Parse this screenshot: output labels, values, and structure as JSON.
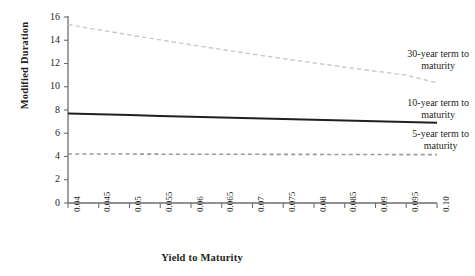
{
  "chart_data": {
    "type": "line",
    "title": "",
    "xlabel": "Yield to Maturity",
    "ylabel": "Modified Duration",
    "xlim": [
      0.04,
      0.1
    ],
    "ylim": [
      0,
      16
    ],
    "grid": false,
    "legend_position": "inline-right-annotations",
    "xticks": [
      "0.04",
      "0.045",
      "0.05",
      "0.055",
      "0.06",
      "0.065",
      "0.07",
      "0.075",
      "0.08",
      "0.085",
      "0.09",
      "0.095",
      "0.10"
    ],
    "xtick_values": [
      0.04,
      0.045,
      0.05,
      0.055,
      0.06,
      0.065,
      0.07,
      0.075,
      0.08,
      0.085,
      0.09,
      0.095,
      0.1
    ],
    "yticks": [
      "0",
      "2",
      "4",
      "6",
      "8",
      "10",
      "12",
      "14",
      "16"
    ],
    "ytick_values": [
      0,
      2,
      4,
      6,
      8,
      10,
      12,
      14,
      16
    ],
    "x": [
      0.04,
      0.045,
      0.05,
      0.055,
      0.06,
      0.065,
      0.07,
      0.075,
      0.08,
      0.085,
      0.09,
      0.095,
      0.1
    ],
    "series": [
      {
        "name": "30-year term to maturity",
        "style": "dashed",
        "color": "#c9c9c9",
        "width": 1.4,
        "values": [
          15.35,
          14.9,
          14.46,
          14.03,
          13.61,
          13.2,
          12.8,
          12.42,
          12.05,
          11.69,
          11.34,
          11.0,
          10.33
        ]
      },
      {
        "name": "10-year term to maturity",
        "style": "solid",
        "color": "#231f20",
        "width": 2.0,
        "values": [
          7.7,
          7.63,
          7.56,
          7.49,
          7.42,
          7.36,
          7.29,
          7.22,
          7.16,
          7.09,
          7.03,
          6.96,
          6.9
        ]
      },
      {
        "name": "5-year term to maturity",
        "style": "dashed",
        "color": "#9a9a9a",
        "width": 1.6,
        "values": [
          4.22,
          4.21,
          4.21,
          4.2,
          4.2,
          4.19,
          4.19,
          4.18,
          4.18,
          4.17,
          4.17,
          4.16,
          4.16
        ]
      }
    ],
    "annotations": [
      {
        "label_line1": "30-year term to",
        "label_line2": "maturity",
        "series": "30-year term to maturity"
      },
      {
        "label_line1": "10-year term to",
        "label_line2": "maturity",
        "series": "10-year term to maturity"
      },
      {
        "label_line1": "5-year term to",
        "label_line2": "maturity",
        "series": "5-year term to maturity"
      }
    ],
    "axis_color": "#6e6e6e"
  }
}
